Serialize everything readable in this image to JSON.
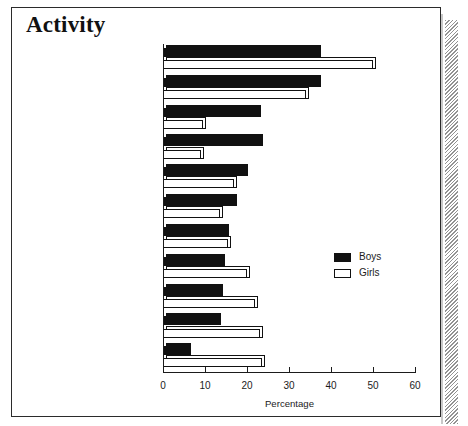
{
  "figure": {
    "title": "Activity",
    "legend": {
      "position": "center-right",
      "entries": [
        {
          "label": "Boys",
          "color": "#111111",
          "style": "filled"
        },
        {
          "label": "Girls",
          "color": "#ffffff",
          "style": "outline"
        }
      ]
    }
  },
  "chart_data": {
    "type": "bar",
    "orientation": "horizontal",
    "title": "Activity",
    "xlabel": "Percentage",
    "ylabel": "",
    "xlim": [
      0,
      60
    ],
    "xticks": [
      0,
      10,
      20,
      30,
      40,
      50,
      60
    ],
    "grid": false,
    "categories": [
      "English",
      "Mathematics",
      "Physics",
      "Other sciences",
      "Geography",
      "Chemistry",
      "History",
      "Biology",
      "French",
      "Music/Drama/Visual Arts",
      "Vocational subjects"
    ],
    "category_footnotes": [
      "",
      "",
      "",
      "b",
      "",
      "",
      "",
      "",
      "",
      "",
      "c"
    ],
    "series": [
      {
        "name": "Boys",
        "color": "#111111",
        "values": [
          37.0,
          37.0,
          22.5,
          23.0,
          19.5,
          17.0,
          15.0,
          14.0,
          13.5,
          13.0,
          6.0
        ]
      },
      {
        "name": "Girls",
        "color": "#ffffff",
        "values": [
          50.0,
          34.0,
          9.5,
          9.0,
          17.0,
          13.5,
          15.5,
          20.0,
          22.0,
          23.0,
          23.5
        ]
      }
    ]
  }
}
